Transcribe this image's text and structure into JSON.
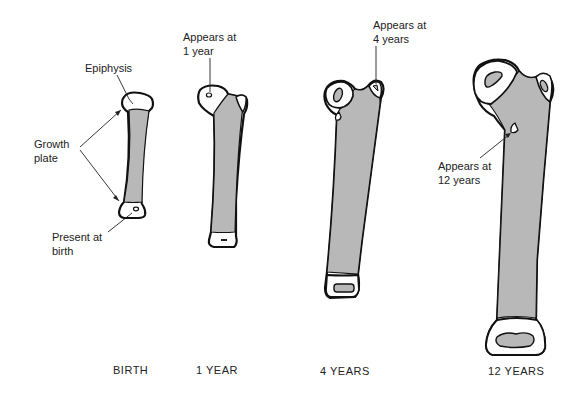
{
  "figure": {
    "colors": {
      "background": "#ffffff",
      "outline": "#111111",
      "diaphysis_fill": "#b8b8b8",
      "epiphysis_fill": "#ffffff",
      "text": "#222222"
    },
    "stages": [
      {
        "id": "birth",
        "caption": "BIRTH"
      },
      {
        "id": "one-year",
        "caption": "1 YEAR"
      },
      {
        "id": "four-years",
        "caption": "4 YEARS"
      },
      {
        "id": "twelve-years",
        "caption": "12 YEARS"
      }
    ],
    "labels": {
      "epiphysis": "Epiphysis",
      "growth_plate_line1": "Growth",
      "growth_plate_line2": "plate",
      "present_at_birth_line1": "Present at",
      "present_at_birth_line2": "birth",
      "appears_1_line1": "Appears at",
      "appears_1_line2": "1 year",
      "appears_4_line1": "Appears at",
      "appears_4_line2": "4 years",
      "appears_12_line1": "Appears at",
      "appears_12_line2": "12 years"
    }
  }
}
